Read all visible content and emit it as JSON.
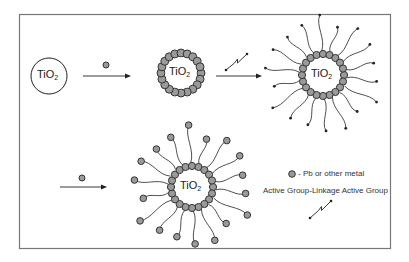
{
  "diagram": {
    "type": "reaction-scheme",
    "frame": {
      "x": 19,
      "y": 14,
      "w": 371,
      "h": 234,
      "stroke": "#777777"
    },
    "colors": {
      "metal_fill": "#9a9a9a",
      "metal_stroke": "#333333",
      "line": "#222222",
      "core_fill": "#ffffff"
    },
    "core_label": {
      "base": "TiO",
      "subscript": "2"
    },
    "steps": [
      {
        "id": "bare-particle",
        "label_base": "TiO",
        "label_sub": "2"
      },
      {
        "id": "metal-coated-particle",
        "label_base": "TiO",
        "label_sub": "2"
      },
      {
        "id": "linker-functionalized-particle",
        "label_base": "TiO",
        "label_sub": "2"
      },
      {
        "id": "metal-terminated-particle",
        "label_base": "TiO",
        "label_sub": "2"
      }
    ],
    "arrows": [
      {
        "id": "arrow-1",
        "reagent": "metal"
      },
      {
        "id": "arrow-2",
        "reagent": "linker"
      },
      {
        "id": "arrow-3",
        "reagent": "metal"
      }
    ],
    "legend": {
      "metal_text": "- Pb or other metal",
      "linker_text": "Active Group-Linkage Active Group"
    }
  }
}
